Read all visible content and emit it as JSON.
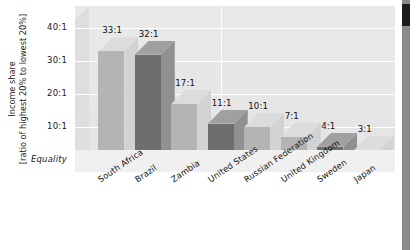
{
  "chart_data": {
    "type": "bar",
    "title": "",
    "xlabel": "",
    "ylabel": "Income share [ratio of highest 20% to lowest 20%]",
    "ylabel_line1": "Income share",
    "ylabel_line2": "[ratio of highest 20% to lowest 20%]",
    "categories": [
      "South Africa",
      "Brazil",
      "Zambia",
      "United States",
      "Russian Federation",
      "United Kingdom",
      "Sweden",
      "Japan"
    ],
    "values": [
      33,
      32,
      17,
      11,
      10,
      7,
      4,
      3
    ],
    "data_labels": [
      "33:1",
      "32:1",
      "17:1",
      "11:1",
      "10:1",
      "7:1",
      "4:1",
      "3:1"
    ],
    "ytick_labels": [
      "40:1",
      "30:1",
      "20:1",
      "10:1",
      "Equality"
    ],
    "ytick_values": [
      40,
      30,
      20,
      10,
      0
    ],
    "ylim": [
      0,
      45
    ],
    "grid": true,
    "legend": "none",
    "bar_shades": [
      "light",
      "dark",
      "light",
      "dark",
      "light",
      "light",
      "dark",
      "light"
    ]
  },
  "colors": {
    "plot_background": "#e6e6e6",
    "gridline": "#ffffff",
    "bar_light_front": "#b4b4b4",
    "bar_light_side": "#d2d2d2",
    "bar_light_top": "#dcdcdc",
    "bar_dark_front": "#6e6e6e",
    "bar_dark_side": "#909090",
    "bar_dark_top": "#a0a0a0",
    "text": "#111111",
    "right_band": "#8a8a8a",
    "right_band_dark": "#1c1c1c",
    "page_background": "#ffffff"
  }
}
